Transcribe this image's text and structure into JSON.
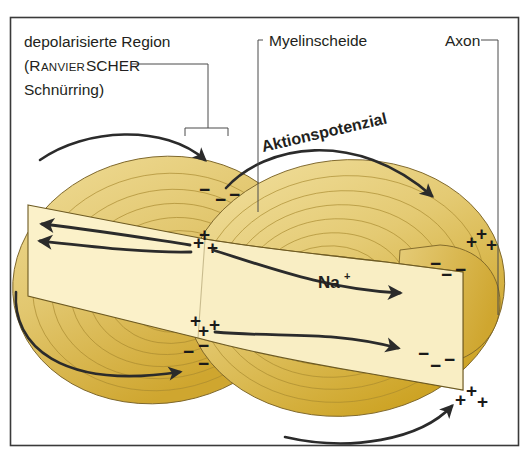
{
  "figure": {
    "frame_color": "#3a3a3a",
    "background_color": "#ffffff"
  },
  "colors": {
    "myelin_light": "#ecd98f",
    "myelin_mid": "#e0c36a",
    "myelin_dark": "#cfa62f",
    "myelin_shadow": "#c79a26",
    "axon_band": "#fbf1c9",
    "ring_stroke": "#a8892f",
    "outline": "#7a6326",
    "arrow": "#2b2b2b",
    "leader": "#4a4a4a",
    "text": "#231f20"
  },
  "labels": {
    "depolarized": {
      "line1": "depolarisierte Region",
      "line2_open": "(R",
      "line2_smallcaps": "ANVIER",
      "line2_rest": "SCHER",
      "line3": "Schnürring)"
    },
    "myelin_sheath": "Myelinscheide",
    "axon": "Axon",
    "action_potential": "Aktionspotenzial",
    "sodium": {
      "element": "Na",
      "charge": "+"
    }
  },
  "charge_groups": [
    {
      "id": "node1-outer-minus",
      "symbol": "−",
      "count": 3,
      "location": "upper-left-node-outside",
      "polarity": "negative"
    },
    {
      "id": "node1-inner-plus",
      "symbol": "+",
      "count": 3,
      "location": "upper-left-node-inside",
      "polarity": "positive"
    },
    {
      "id": "node2-inner-plus",
      "symbol": "+",
      "count": 3,
      "location": "lower-left-node-inside",
      "polarity": "positive"
    },
    {
      "id": "node2-outer-minus",
      "symbol": "−",
      "count": 3,
      "location": "lower-left-node-outside",
      "polarity": "negative"
    },
    {
      "id": "node3-outer-plus",
      "symbol": "+",
      "count": 3,
      "location": "upper-right-node-outside",
      "polarity": "positive"
    },
    {
      "id": "node3-inner-minus",
      "symbol": "−",
      "count": 3,
      "location": "upper-right-node-inside",
      "polarity": "negative"
    },
    {
      "id": "node4-inner-minus",
      "symbol": "−",
      "count": 3,
      "location": "lower-right-node-inside",
      "polarity": "negative"
    },
    {
      "id": "node4-outer-plus",
      "symbol": "+",
      "count": 3,
      "location": "lower-right-node-outside",
      "polarity": "positive"
    }
  ],
  "arrows": {
    "external_upper_left": "current loop arcing from left over the sheath into the upper left node",
    "external_lower_left": "current loop arcing from lower left up into the lower left node",
    "action_potential_arc": "long arc labelled Aktionspotenzial sweeping right and down to the right node",
    "external_lower_right": "current loop arcing from below right up to the lower right node",
    "internal_left_upper": "axoplasmic current arrow pointing left (upper)",
    "internal_left_lower": "axoplasmic current arrow pointing left (lower)",
    "internal_right_upper": "axoplasmic current arrow pointing right toward Na+ node",
    "internal_right_lower": "axoplasmic current arrow pointing right and down to lower right node"
  }
}
